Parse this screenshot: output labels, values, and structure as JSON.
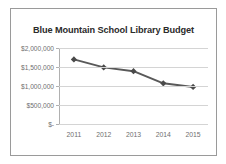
{
  "chart_data": {
    "type": "line",
    "title": "Blue Mountain School Library Budget",
    "xlabel": "",
    "ylabel": "",
    "categories": [
      "2011",
      "2012",
      "2013",
      "2014",
      "2015"
    ],
    "values": [
      1700000,
      1490000,
      1390000,
      1070000,
      975000
    ],
    "series": [
      {
        "name": "Budget",
        "values": [
          1700000,
          1490000,
          1390000,
          1070000,
          975000
        ]
      }
    ],
    "ylim": [
      0,
      2000000
    ],
    "ytick_values": [
      0,
      500000,
      1000000,
      1500000,
      2000000
    ],
    "ytick_labels": [
      "$-",
      "$500,000",
      "$1,000,000",
      "$1,500,000",
      "$2,000,000"
    ],
    "xtick_labels": [
      "2011",
      "2012",
      "2013",
      "2014",
      "2015"
    ],
    "grid": true,
    "legend": false,
    "legend_position": "none",
    "colors": {
      "line": "#595959",
      "marker": "#4a4a4a",
      "gridline": "#d4d4d4",
      "axis": "#b0b0b0",
      "tick_text": "#6f6f6f",
      "title_text": "#2b2b2b",
      "frame": "#9a9a9a",
      "background": "#ffffff"
    }
  }
}
